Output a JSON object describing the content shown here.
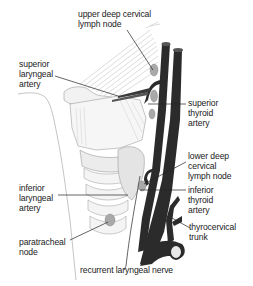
{
  "diagram": {
    "colors": {
      "vessel": "#2b2b2b",
      "node": "#a9a9a9",
      "tissue_line": "#8a8a8a",
      "leader": "#222222",
      "background": "#ffffff"
    },
    "labels": {
      "upper_deep_cervical": [
        "upper deep cervical",
        "lymph node"
      ],
      "superior_laryngeal_artery": [
        "superior",
        "laryngeal",
        "artery"
      ],
      "superior_thyroid_artery": [
        "superior",
        "thyroid",
        "artery"
      ],
      "lower_deep_cervical": [
        "lower deep",
        "cervical",
        "lymph node"
      ],
      "inferior_laryngeal_artery": [
        "inferior",
        "laryngeal",
        "artery"
      ],
      "inferior_thyroid_artery": [
        "inferior",
        "thyroid",
        "artery"
      ],
      "paratracheal_node": [
        "paratracheal",
        "node"
      ],
      "thyrocervical_trunk": [
        "thyrocervical",
        "trunk"
      ],
      "recurrent_laryngeal_nerve": [
        "recurrent laryngeal nerve"
      ]
    }
  }
}
